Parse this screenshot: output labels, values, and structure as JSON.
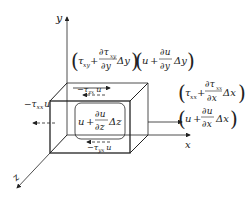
{
  "axes": {
    "y_label": "y",
    "x_label": "x",
    "z_label": "z"
  },
  "terms": {
    "tau_xy_top": {
      "tau": "τ",
      "sub": "xy",
      "plus": "+",
      "num_d": "∂τ",
      "num_sub": "xy",
      "den": "∂y",
      "delta": "Δy"
    },
    "u_y": {
      "u": "u",
      "plus": "+",
      "num": "∂u",
      "den": "∂y",
      "delta": "Δy"
    },
    "tau_xx_right": {
      "tau": "τ",
      "sub": "xx",
      "plus": "+",
      "num_d": "∂τ",
      "num_sub": "xx",
      "den": "∂x",
      "delta": "Δx"
    },
    "u_x": {
      "u": "u",
      "plus": "+",
      "num": "∂u",
      "den": "∂x",
      "delta": "Δx"
    },
    "u_z": {
      "u": "u",
      "plus": "+",
      "num": "∂u",
      "den": "∂z",
      "delta": "Δz"
    },
    "neg_tau_xx_u": {
      "minus": "−",
      "tau": "τ",
      "sub": "xx",
      "u": "u"
    },
    "neg_tau_zx_u_top": {
      "minus": "−",
      "tau": "τ",
      "sub": "zx",
      "u": "u"
    },
    "tau_zx_u_top": {
      "tau": "τ",
      "sub": "zx",
      "u": "u"
    },
    "neg_tau_yx_u_bottom": {
      "minus": "−",
      "tau": "τ",
      "sub": "yx",
      "u": "u"
    }
  },
  "colors": {
    "line": "#222222",
    "background": "#ffffff"
  }
}
